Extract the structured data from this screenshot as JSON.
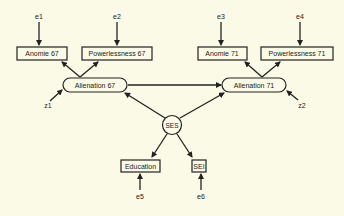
{
  "diagram": {
    "type": "structural-equation-model",
    "observed": {
      "anomie67": "Anomie 67",
      "powerlessness67": "Powerlessness 67",
      "anomie71": "Anomie 71",
      "powerlessness71": "Powerlessness 71",
      "education": "Education",
      "sei": "SEI"
    },
    "latent": {
      "alienation67": "Alienation 67",
      "alienation71": "Alienation 71",
      "ses": "SES"
    },
    "errors": {
      "e1": "e1",
      "e2": "e2",
      "e3": "e3",
      "e4": "e4",
      "e5": "e5",
      "e6": "e6",
      "z1": "z1",
      "z2": "z2"
    },
    "colors": {
      "background": "#fbfae6",
      "ink": "#222222"
    }
  }
}
